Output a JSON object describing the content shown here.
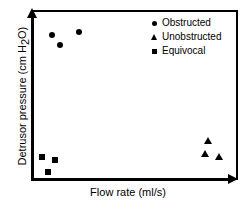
{
  "chart_data": {
    "type": "scatter",
    "title": "",
    "xlabel": "Flow rate (ml/s)",
    "ylabel": "Detrusor pressure (cm H2O)",
    "ylabel_parts": {
      "main": "Detrusor pressure (cm H",
      "subscript": "2",
      "tail": "O)"
    },
    "grid": false,
    "axis_ticks": false,
    "axis_arrows": true,
    "xlim": [
      0,
      100
    ],
    "ylim": [
      0,
      100
    ],
    "legend_position": "top-right",
    "marker_color": "#000000",
    "frame_color": "#000000",
    "background_color": "#ffffff",
    "series": [
      {
        "name": "Obstructed",
        "marker": "circle",
        "points": [
          {
            "x": 9.3,
            "y": 85.3
          },
          {
            "x": 13.2,
            "y": 79.4
          },
          {
            "x": 22.5,
            "y": 87.1
          }
        ]
      },
      {
        "name": "Unobstructed",
        "marker": "triangle",
        "points": [
          {
            "x": 85.8,
            "y": 23.5
          },
          {
            "x": 84.3,
            "y": 15.3
          },
          {
            "x": 91.2,
            "y": 14.1
          }
        ]
      },
      {
        "name": "Equivocal",
        "marker": "square",
        "points": [
          {
            "x": 4.4,
            "y": 13.5
          },
          {
            "x": 10.8,
            "y": 11.8
          },
          {
            "x": 7.4,
            "y": 4.7
          }
        ]
      }
    ],
    "legend": [
      {
        "label": "Obstructed",
        "marker": "circle"
      },
      {
        "label": "Unobstructed",
        "marker": "triangle"
      },
      {
        "label": "Equivocal",
        "marker": "square"
      }
    ]
  }
}
